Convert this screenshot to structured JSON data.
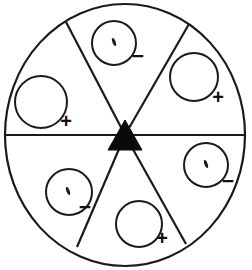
{
  "figure": {
    "type": "sector-diagram",
    "canvas": {
      "width": 252,
      "height": 270
    },
    "stroke_color": "#1a1a1a",
    "fill_color": "#ffffff",
    "outer_circle": {
      "label": "outer boundary circle",
      "cx": 125,
      "cy": 135,
      "rx": 120,
      "ry": 131,
      "stroke_width": 2.2
    },
    "center_marker": {
      "label": "center triangle",
      "shape": "filled-triangle-up",
      "cx": 125,
      "cy": 135,
      "half_width": 17,
      "height": 30,
      "color": "#0a0a0a"
    },
    "divider_lines": [
      {
        "name": "horizontal-diameter",
        "x1": 5,
        "y1": 135,
        "x2": 245,
        "y2": 135
      },
      {
        "name": "upper-left-radius",
        "x1": 125,
        "y1": 135,
        "x2": 66,
        "y2": 22
      },
      {
        "name": "upper-right-radius",
        "x1": 125,
        "y1": 135,
        "x2": 189,
        "y2": 24
      },
      {
        "name": "lower-left-radius",
        "x1": 125,
        "y1": 135,
        "x2": 77,
        "y2": 247
      },
      {
        "name": "lower-right-radius",
        "x1": 125,
        "y1": 135,
        "x2": 186,
        "y2": 244
      }
    ],
    "sectors": [
      {
        "id": "top",
        "name": "top-sector",
        "circle": {
          "cx": 114,
          "cy": 43,
          "r": 22,
          "marked": true
        },
        "mark": {
          "type": "tick",
          "cx": 114,
          "cy": 42,
          "angle": -20
        },
        "sign": {
          "symbol": "−",
          "name": "minus",
          "x": 138,
          "y": 63
        }
      },
      {
        "id": "upper-right",
        "name": "upper-right-sector",
        "circle": {
          "cx": 194,
          "cy": 77,
          "r": 24,
          "marked": false
        },
        "mark": null,
        "sign": {
          "symbol": "+",
          "name": "plus",
          "x": 218,
          "y": 104
        }
      },
      {
        "id": "lower-right",
        "name": "lower-right-sector",
        "circle": {
          "cx": 206,
          "cy": 165,
          "r": 22,
          "marked": true
        },
        "mark": {
          "type": "tick",
          "cx": 206,
          "cy": 164,
          "angle": -20
        },
        "sign": {
          "symbol": "−",
          "name": "minus",
          "x": 228,
          "y": 188
        }
      },
      {
        "id": "bottom",
        "name": "bottom-sector",
        "circle": {
          "cx": 139,
          "cy": 224,
          "r": 23,
          "marked": false
        },
        "mark": null,
        "sign": {
          "symbol": "+",
          "name": "plus",
          "x": 162,
          "y": 245
        }
      },
      {
        "id": "lower-left",
        "name": "lower-left-sector",
        "circle": {
          "cx": 69,
          "cy": 192,
          "r": 23,
          "marked": true
        },
        "mark": {
          "type": "tick",
          "cx": 68,
          "cy": 191,
          "angle": -20
        },
        "sign": {
          "symbol": "−",
          "name": "minus",
          "x": 85,
          "y": 214
        }
      },
      {
        "id": "left",
        "name": "left-sector",
        "circle": {
          "cx": 41,
          "cy": 102,
          "r": 26,
          "marked": false
        },
        "mark": null,
        "sign": {
          "symbol": "+",
          "name": "plus",
          "x": 66,
          "y": 128
        }
      }
    ]
  }
}
